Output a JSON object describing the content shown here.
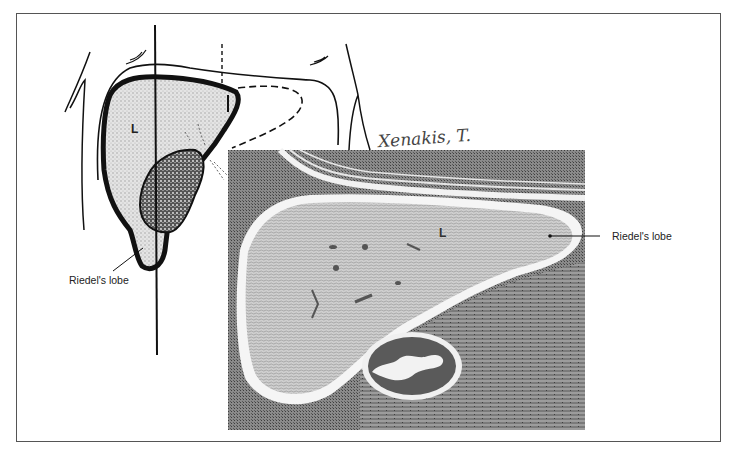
{
  "figure": {
    "type": "anatomical-illustration",
    "panels": [
      {
        "name": "line-drawing",
        "description": "Anterior abdominal outline showing liver (L), gallbladder and Riedel's lobe extending inferiorly",
        "labels": {
          "organ_letter": "L",
          "callout": "Riedel's lobe"
        }
      },
      {
        "name": "ct-scan",
        "description": "Cross-sectional CT-style image of liver with kidney below",
        "labels": {
          "organ_letter": "L",
          "callout": "Riedel's lobe"
        }
      }
    ],
    "signature": "Xenakis, T."
  },
  "colors": {
    "ink": "#111111",
    "frame": "#555555",
    "liver_fill": "#d9d9d9",
    "ct_background": "#6a6a6a",
    "ct_liver": "#b8b8b8",
    "paper": "#ffffff"
  }
}
